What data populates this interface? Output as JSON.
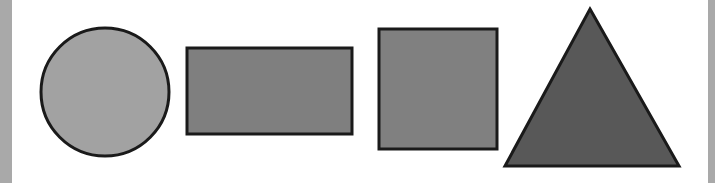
{
  "canvas": {
    "width": 715,
    "height": 183,
    "background": "#ffffff"
  },
  "frame": {
    "left_strip": {
      "x": 0,
      "width": 12,
      "color": "#a9a9a9"
    },
    "right_strip": {
      "x": 708,
      "width": 7,
      "color": "#a9a9a9"
    }
  },
  "shapes": [
    {
      "type": "circle",
      "label": "circle",
      "cx": 105,
      "cy": 92,
      "r": 64,
      "fill": "#a2a2a2",
      "stroke": "#1a1a1a",
      "stroke_width": 3
    },
    {
      "type": "rectangle",
      "label": "rectangle",
      "x": 187,
      "y": 48,
      "width": 165,
      "height": 86,
      "fill": "#7f7f7f",
      "stroke": "#1a1a1a",
      "stroke_width": 3
    },
    {
      "type": "square",
      "label": "square",
      "x": 379,
      "y": 29,
      "width": 118,
      "height": 120,
      "fill": "#808080",
      "stroke": "#1a1a1a",
      "stroke_width": 3
    },
    {
      "type": "triangle",
      "label": "triangle",
      "points": "590,9 679,166 505,166",
      "fill": "#585858",
      "stroke": "#1a1a1a",
      "stroke_width": 3
    }
  ]
}
